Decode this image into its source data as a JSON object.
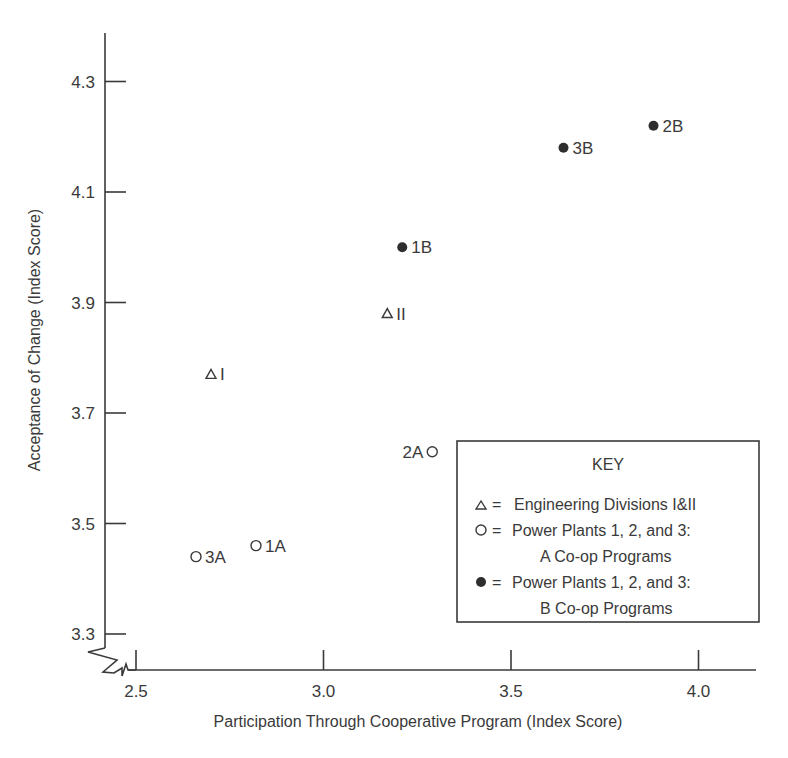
{
  "chart_data": {
    "type": "scatter",
    "title": "",
    "xlabel": "Participation Through Cooperative Program (Index Score)",
    "ylabel": "Acceptance of Change (Index Score)",
    "xlim": [
      2.5,
      4.15
    ],
    "ylim": [
      3.3,
      4.35
    ],
    "x_ticks": [
      "2.5",
      "3.0",
      "3.5",
      "4.0"
    ],
    "y_ticks": [
      "3.3",
      "3.5",
      "3.7",
      "3.9",
      "4.1",
      "4.3"
    ],
    "grid": false,
    "axis_break": true,
    "legend_position": "lower right (boxed)",
    "legend_title": "KEY",
    "series": [
      {
        "name": "Engineering Divisions I&II",
        "marker": "triangle-open",
        "points": [
          {
            "label": "I",
            "x": 2.7,
            "y": 3.77
          },
          {
            "label": "II",
            "x": 3.17,
            "y": 3.88
          }
        ]
      },
      {
        "name": "Power Plants 1, 2, and 3: A Co-op Programs",
        "marker": "circle-open",
        "points": [
          {
            "label": "1A",
            "x": 2.82,
            "y": 3.46
          },
          {
            "label": "2A",
            "x": 3.29,
            "y": 3.63
          },
          {
            "label": "3A",
            "x": 2.66,
            "y": 3.44
          }
        ]
      },
      {
        "name": "Power Plants 1, 2, and 3: B Co-op Programs",
        "marker": "circle-filled",
        "points": [
          {
            "label": "1B",
            "x": 3.21,
            "y": 4.0
          },
          {
            "label": "2B",
            "x": 3.88,
            "y": 4.22
          },
          {
            "label": "3B",
            "x": 3.64,
            "y": 4.18
          }
        ]
      }
    ]
  },
  "legend": {
    "title": "KEY",
    "entries": [
      {
        "symbol": "△ =",
        "line1": "Engineering Divisions I&II",
        "line2": ""
      },
      {
        "symbol": "O =",
        "line1": "Power Plants 1, 2, and 3:",
        "line2": "A Co-op Programs"
      },
      {
        "symbol": "● =",
        "line1": "Power Plants 1, 2, and 3:",
        "line2": "B Co-op Programs"
      }
    ]
  },
  "colors": {
    "ink": "#3a3a3a",
    "background": "#ffffff"
  }
}
